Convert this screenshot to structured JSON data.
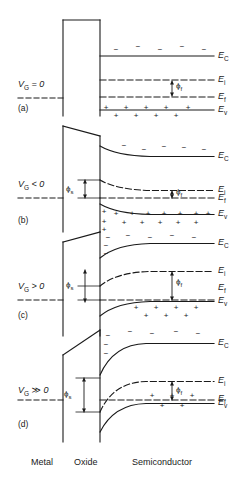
{
  "figure": {
    "type": "diagram",
    "width": 240,
    "height": 484,
    "line_color": "#1a1a1a",
    "background": "#ffffff"
  },
  "regions": [
    {
      "id": "metal",
      "label": "Metal",
      "x": 46,
      "y": 463
    },
    {
      "id": "oxide",
      "label": "Oxide",
      "x": 96,
      "y": 463
    },
    {
      "id": "semiconductor",
      "label": "Semiconductor",
      "x": 160,
      "y": 463
    }
  ],
  "band_labels": {
    "ec": "E",
    "ec_sub": "C",
    "ei": "E",
    "ei_sub": "i",
    "ef": "E",
    "ef_sub": "f",
    "ev": "E",
    "ev_sub": "v"
  },
  "potential_labels": {
    "phi_s": "ϕ",
    "phi_s_sub": "s",
    "phi_f": "ϕ",
    "phi_f_sub": "f"
  },
  "carrier_glyphs": {
    "hole": "+",
    "electron": "−"
  },
  "panels": [
    {
      "id": "a",
      "panel_id": "(a)",
      "bias_label": "V",
      "bias_sub": "G",
      "bias_rel": " = 0",
      "condition": "flat band",
      "band_bending": 0,
      "phi_s_shown": false,
      "phi_f_shown": true,
      "holes": 11,
      "electrons": 5,
      "inversion": false
    },
    {
      "id": "b",
      "panel_id": "(b)",
      "bias_label": "V",
      "bias_sub": "G",
      "bias_rel": " < 0",
      "condition": "accumulation",
      "band_bending": -9,
      "phi_s_shown": true,
      "phi_f_shown": true,
      "holes": 18,
      "electrons": 6,
      "inversion": false
    },
    {
      "id": "c",
      "panel_id": "(c)",
      "bias_label": "V",
      "bias_sub": "G",
      "bias_rel": " > 0",
      "condition": "depletion",
      "band_bending": 14,
      "phi_s_shown": true,
      "phi_f_shown": true,
      "holes": 11,
      "electrons": 10,
      "inversion": false
    },
    {
      "id": "d",
      "panel_id": "(d)",
      "bias_label": "V",
      "bias_sub": "G",
      "bias_rel": " ≫ 0",
      "condition": "inversion",
      "band_bending": 34,
      "phi_s_shown": true,
      "phi_f_shown": true,
      "holes": 5,
      "electrons": 6,
      "inversion": true
    }
  ],
  "geometry": {
    "metal_right_x": 63,
    "oxide_left_x": 63,
    "oxide_right_x": 100,
    "semi_right_x": 214,
    "label_x": 218
  }
}
